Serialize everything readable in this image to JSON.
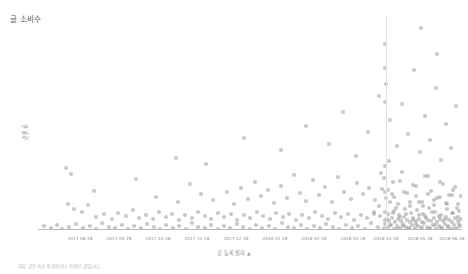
{
  "chart_data": {
    "type": "scatter",
    "title": "글 소비수",
    "ylabel": "순위권",
    "xlabel": "글 등록일자",
    "xlabel_sort_indicator": "▲",
    "grid": false,
    "legend": null,
    "xlim": [
      0,
      424
    ],
    "ylim": [
      0,
      1
    ],
    "marker": {
      "shape": "circle",
      "color": "#9a9a9a",
      "opacity": 0.55,
      "radius": 2.1
    },
    "reference_line": {
      "x_px": 348,
      "color": "#e2e2e2",
      "orientation": "vertical"
    },
    "xtick_labels": [
      "2017 08 28",
      "2017 09 28",
      "2017 10 28",
      "2017 11 28",
      "2017 12 28",
      "2018 01 28",
      "2018 02 28",
      "2018 03 28",
      "2018 04 28",
      "2018 05 28",
      "2018 06 28"
    ],
    "xtick_positions_px": [
      42,
      81,
      120,
      159,
      198,
      237,
      276,
      315,
      348,
      382,
      414
    ],
    "points": [
      [
        6,
        210
      ],
      [
        13,
        212
      ],
      [
        19,
        209
      ],
      [
        24,
        213
      ],
      [
        31,
        211
      ],
      [
        38,
        208
      ],
      [
        45,
        212
      ],
      [
        52,
        210
      ],
      [
        58,
        213
      ],
      [
        64,
        207
      ],
      [
        71,
        211
      ],
      [
        77,
        212
      ],
      [
        84,
        209
      ],
      [
        90,
        213
      ],
      [
        96,
        210
      ],
      [
        103,
        212
      ],
      [
        109,
        208
      ],
      [
        116,
        211
      ],
      [
        122,
        213
      ],
      [
        128,
        209
      ],
      [
        135,
        212
      ],
      [
        141,
        210
      ],
      [
        148,
        213
      ],
      [
        154,
        207
      ],
      [
        160,
        211
      ],
      [
        167,
        212
      ],
      [
        173,
        209
      ],
      [
        180,
        213
      ],
      [
        186,
        210
      ],
      [
        192,
        212
      ],
      [
        199,
        208
      ],
      [
        205,
        211
      ],
      [
        212,
        213
      ],
      [
        218,
        209
      ],
      [
        224,
        212
      ],
      [
        231,
        210
      ],
      [
        237,
        213
      ],
      [
        244,
        207
      ],
      [
        250,
        211
      ],
      [
        256,
        212
      ],
      [
        263,
        209
      ],
      [
        269,
        213
      ],
      [
        276,
        210
      ],
      [
        282,
        212
      ],
      [
        288,
        208
      ],
      [
        295,
        211
      ],
      [
        301,
        213
      ],
      [
        308,
        209
      ],
      [
        314,
        212
      ],
      [
        320,
        210
      ],
      [
        327,
        213
      ],
      [
        333,
        207
      ],
      [
        340,
        211
      ],
      [
        346,
        212
      ],
      [
        352,
        209
      ],
      [
        359,
        213
      ],
      [
        365,
        210
      ],
      [
        371,
        212
      ],
      [
        378,
        208
      ],
      [
        384,
        211
      ],
      [
        391,
        213
      ],
      [
        397,
        209
      ],
      [
        403,
        212
      ],
      [
        410,
        210
      ],
      [
        416,
        213
      ],
      [
        421,
        208
      ],
      [
        28,
        152
      ],
      [
        33,
        158
      ],
      [
        30,
        188
      ],
      [
        36,
        193
      ],
      [
        44,
        196
      ],
      [
        50,
        189
      ],
      [
        58,
        201
      ],
      [
        66,
        198
      ],
      [
        74,
        203
      ],
      [
        80,
        197
      ],
      [
        88,
        200
      ],
      [
        95,
        194
      ],
      [
        101,
        202
      ],
      [
        108,
        199
      ],
      [
        115,
        203
      ],
      [
        121,
        196
      ],
      [
        128,
        201
      ],
      [
        134,
        198
      ],
      [
        141,
        204
      ],
      [
        147,
        199
      ],
      [
        154,
        202
      ],
      [
        160,
        196
      ],
      [
        167,
        200
      ],
      [
        173,
        203
      ],
      [
        180,
        197
      ],
      [
        186,
        201
      ],
      [
        193,
        198
      ],
      [
        199,
        204
      ],
      [
        206,
        199
      ],
      [
        212,
        202
      ],
      [
        219,
        196
      ],
      [
        225,
        200
      ],
      [
        232,
        203
      ],
      [
        238,
        197
      ],
      [
        245,
        201
      ],
      [
        251,
        198
      ],
      [
        258,
        204
      ],
      [
        264,
        199
      ],
      [
        271,
        202
      ],
      [
        277,
        196
      ],
      [
        284,
        200
      ],
      [
        290,
        203
      ],
      [
        297,
        197
      ],
      [
        303,
        201
      ],
      [
        310,
        198
      ],
      [
        316,
        204
      ],
      [
        323,
        199
      ],
      [
        329,
        202
      ],
      [
        336,
        196
      ],
      [
        342,
        200
      ],
      [
        349,
        203
      ],
      [
        355,
        197
      ],
      [
        362,
        201
      ],
      [
        368,
        198
      ],
      [
        375,
        204
      ],
      [
        381,
        199
      ],
      [
        388,
        202
      ],
      [
        394,
        196
      ],
      [
        401,
        200
      ],
      [
        407,
        203
      ],
      [
        414,
        197
      ],
      [
        420,
        201
      ],
      [
        56,
        175
      ],
      [
        98,
        163
      ],
      [
        118,
        181
      ],
      [
        140,
        186
      ],
      [
        152,
        168
      ],
      [
        163,
        178
      ],
      [
        175,
        184
      ],
      [
        189,
        176
      ],
      [
        196,
        188
      ],
      [
        203,
        172
      ],
      [
        210,
        183
      ],
      [
        217,
        166
      ],
      [
        223,
        180
      ],
      [
        230,
        174
      ],
      [
        236,
        187
      ],
      [
        243,
        170
      ],
      [
        249,
        182
      ],
      [
        256,
        159
      ],
      [
        262,
        177
      ],
      [
        268,
        185
      ],
      [
        275,
        164
      ],
      [
        281,
        179
      ],
      [
        287,
        171
      ],
      [
        294,
        186
      ],
      [
        300,
        161
      ],
      [
        306,
        176
      ],
      [
        313,
        183
      ],
      [
        319,
        167
      ],
      [
        325,
        178
      ],
      [
        331,
        172
      ],
      [
        337,
        184
      ],
      [
        343,
        157
      ],
      [
        350,
        174
      ],
      [
        356,
        181
      ],
      [
        362,
        165
      ],
      [
        369,
        177
      ],
      [
        375,
        169
      ],
      [
        381,
        186
      ],
      [
        387,
        160
      ],
      [
        393,
        175
      ],
      [
        399,
        182
      ],
      [
        405,
        168
      ],
      [
        411,
        179
      ],
      [
        417,
        171
      ],
      [
        138,
        142
      ],
      [
        168,
        148
      ],
      [
        206,
        122
      ],
      [
        243,
        134
      ],
      [
        268,
        110
      ],
      [
        291,
        128
      ],
      [
        305,
        96
      ],
      [
        318,
        140
      ],
      [
        330,
        116
      ],
      [
        341,
        80
      ],
      [
        348,
        68
      ],
      [
        352,
        104
      ],
      [
        359,
        130
      ],
      [
        364,
        88
      ],
      [
        370,
        118
      ],
      [
        376,
        54
      ],
      [
        382,
        136
      ],
      [
        387,
        100
      ],
      [
        392,
        124
      ],
      [
        398,
        72
      ],
      [
        403,
        144
      ],
      [
        408,
        108
      ],
      [
        413,
        132
      ],
      [
        418,
        90
      ],
      [
        347,
        28
      ],
      [
        347,
        52
      ],
      [
        383,
        12
      ],
      [
        347,
        86
      ],
      [
        399,
        38
      ],
      [
        347,
        150
      ],
      [
        347,
        176
      ],
      [
        347,
        196
      ],
      [
        347,
        204
      ],
      [
        347,
        208
      ],
      [
        355,
        166
      ],
      [
        341,
        190
      ],
      [
        352,
        186
      ],
      [
        346,
        162
      ],
      [
        351,
        145
      ],
      [
        344,
        173
      ],
      [
        358,
        192
      ],
      [
        336,
        198
      ],
      [
        364,
        156
      ],
      [
        372,
        186
      ],
      [
        378,
        170
      ],
      [
        385,
        190
      ],
      [
        390,
        160
      ],
      [
        396,
        184
      ],
      [
        402,
        166
      ],
      [
        409,
        188
      ],
      [
        415,
        174
      ],
      [
        419,
        192
      ],
      [
        423,
        180
      ],
      [
        350,
        212
      ],
      [
        353,
        209
      ],
      [
        356,
        213
      ],
      [
        359,
        210
      ],
      [
        362,
        212
      ],
      [
        365,
        208
      ],
      [
        368,
        211
      ],
      [
        371,
        213
      ],
      [
        374,
        209
      ],
      [
        377,
        212
      ],
      [
        380,
        210
      ],
      [
        383,
        213
      ],
      [
        386,
        207
      ],
      [
        389,
        211
      ],
      [
        392,
        212
      ],
      [
        395,
        209
      ],
      [
        398,
        213
      ],
      [
        401,
        210
      ],
      [
        404,
        212
      ],
      [
        407,
        208
      ],
      [
        410,
        211
      ],
      [
        413,
        213
      ],
      [
        416,
        209
      ],
      [
        419,
        212
      ],
      [
        422,
        210
      ],
      [
        351,
        205
      ],
      [
        354,
        202
      ],
      [
        357,
        206
      ],
      [
        360,
        203
      ],
      [
        363,
        205
      ],
      [
        366,
        201
      ],
      [
        369,
        204
      ],
      [
        372,
        206
      ],
      [
        375,
        202
      ],
      [
        378,
        205
      ],
      [
        381,
        203
      ],
      [
        384,
        206
      ],
      [
        387,
        200
      ],
      [
        390,
        204
      ],
      [
        393,
        205
      ],
      [
        396,
        202
      ],
      [
        399,
        206
      ],
      [
        402,
        203
      ],
      [
        405,
        205
      ],
      [
        408,
        201
      ],
      [
        411,
        204
      ],
      [
        414,
        206
      ],
      [
        417,
        202
      ],
      [
        420,
        205
      ],
      [
        423,
        203
      ],
      [
        350,
        198
      ],
      [
        356,
        195
      ],
      [
        361,
        199
      ],
      [
        367,
        193
      ],
      [
        373,
        197
      ],
      [
        379,
        194
      ],
      [
        385,
        198
      ],
      [
        391,
        192
      ],
      [
        397,
        196
      ],
      [
        403,
        199
      ],
      [
        409,
        193
      ],
      [
        415,
        197
      ],
      [
        421,
        195
      ],
      [
        348,
        182
      ],
      [
        354,
        178
      ],
      [
        360,
        188
      ],
      [
        366,
        176
      ],
      [
        372,
        190
      ],
      [
        378,
        180
      ],
      [
        384,
        186
      ],
      [
        390,
        178
      ],
      [
        396,
        189
      ],
      [
        402,
        181
      ],
      [
        408,
        187
      ],
      [
        414,
        179
      ],
      [
        420,
        188
      ]
    ]
  },
  "caption": {
    "text": "해당 글은 비공개 글이거나 삭제된 글입니다."
  }
}
